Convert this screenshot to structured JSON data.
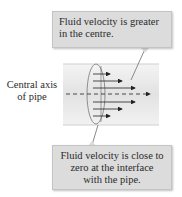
{
  "callouts": {
    "top": {
      "lines": [
        "Fluid velocity is greater",
        "in the centre."
      ]
    },
    "bottom": {
      "lines": [
        "Fluid velocity is close to",
        "zero at the interface",
        "with the pipe."
      ]
    }
  },
  "axis_label": {
    "lines": [
      "Central axis",
      "of pipe"
    ]
  },
  "colors": {
    "callout_fill": "#dcdcdc",
    "pipe_fill": "#eeeeee",
    "arrow": "#222222",
    "pointer": "#8a8a8a"
  }
}
